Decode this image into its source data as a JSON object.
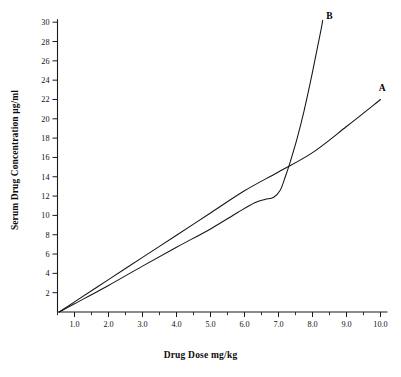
{
  "chart_data": {
    "type": "line",
    "title": "",
    "xlabel": "Drug Dose mg/kg",
    "ylabel": "Serum Drug Concentration µg/ml",
    "xlim": [
      0.5,
      10.2
    ],
    "ylim": [
      0,
      31
    ],
    "grid": false,
    "legend_position": "inline-end-of-line",
    "xticks": [
      1.0,
      2.0,
      3.0,
      4.0,
      5.0,
      6.0,
      7.0,
      8.0,
      9.0,
      10.0
    ],
    "xticklabels": [
      "1.0",
      "2.0",
      "3.0",
      "4.0",
      "5.0",
      "6.0",
      "7.0",
      "8.0",
      "9.0",
      "10.0"
    ],
    "xminorticks": [
      0.5,
      1.5,
      2.5,
      3.5,
      4.5,
      5.5,
      6.5,
      7.5,
      8.5,
      9.5
    ],
    "yticks": [
      2,
      4,
      6,
      8,
      10,
      12,
      14,
      16,
      18,
      20,
      22,
      24,
      26,
      28,
      30
    ],
    "yticklabels": [
      "2",
      "4",
      "6",
      "8",
      "10",
      "12",
      "14",
      "16",
      "18",
      "20",
      "22",
      "24",
      "26",
      "28",
      "30"
    ],
    "series": [
      {
        "name": "A",
        "label": "A",
        "label_x": 10.05,
        "label_y": 22.9,
        "color": "#141414",
        "points": [
          [
            0.55,
            0.0
          ],
          [
            1.0,
            1.05
          ],
          [
            2.0,
            3.35
          ],
          [
            3.0,
            5.65
          ],
          [
            4.0,
            7.95
          ],
          [
            5.0,
            10.25
          ],
          [
            6.0,
            12.55
          ],
          [
            7.0,
            14.5
          ],
          [
            8.0,
            16.5
          ],
          [
            9.0,
            19.2
          ],
          [
            10.0,
            22.0
          ]
        ]
      },
      {
        "name": "B",
        "label": "B",
        "label_x": 8.5,
        "label_y": 30.3,
        "color": "#141414",
        "points": [
          [
            0.55,
            0.0
          ],
          [
            1.0,
            0.85
          ],
          [
            2.0,
            2.75
          ],
          [
            3.0,
            4.75
          ],
          [
            4.0,
            6.7
          ],
          [
            5.0,
            8.6
          ],
          [
            5.8,
            10.3
          ],
          [
            6.3,
            11.3
          ],
          [
            6.6,
            11.65
          ],
          [
            6.85,
            11.85
          ],
          [
            7.05,
            12.6
          ],
          [
            7.2,
            14.0
          ],
          [
            7.35,
            15.6
          ],
          [
            7.55,
            18.0
          ],
          [
            7.75,
            20.8
          ],
          [
            7.95,
            24.0
          ],
          [
            8.1,
            26.6
          ],
          [
            8.25,
            29.2
          ],
          [
            8.3,
            30.2
          ]
        ]
      }
    ],
    "annotations": [
      {
        "text": "A",
        "x": 10.05,
        "y": 22.9
      },
      {
        "text": "B",
        "x": 8.5,
        "y": 30.3
      }
    ]
  }
}
